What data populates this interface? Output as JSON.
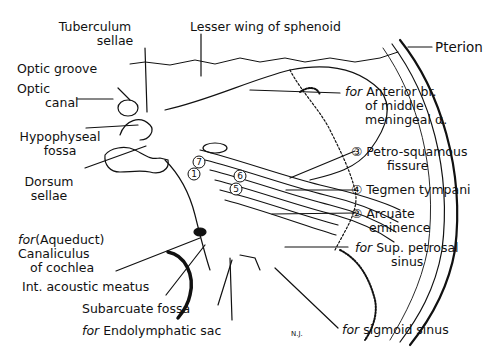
{
  "figure": {
    "labels": {
      "tuberculum_sellae": [
        "Tuberculum",
        "sellae"
      ],
      "lesser_wing": "Lesser wing of sphenoid",
      "pterion": "Pterion",
      "optic_groove": "Optic groove",
      "optic_canal": [
        "Optic",
        "canal"
      ],
      "hypophyseal_fossa": [
        "Hypophyseal",
        "fossa"
      ],
      "dorsum_sellae": [
        "Dorsum",
        "sellae"
      ],
      "aqueduct": [
        "for",
        "(Aqueduct)",
        "Canaliculus",
        "of cochlea"
      ],
      "int_acoustic": "Int. acoustic meatus",
      "subarcuate": "Subarcuate fossa",
      "endolymphatic": [
        "for",
        "Endolymphatic sac"
      ],
      "sigmoid": [
        "for",
        "sigmoid sinus"
      ],
      "sup_petrosal": [
        "for",
        "Sup. petrosal",
        "sinus"
      ],
      "arcuate": [
        "②",
        "Arcuate",
        "eminence"
      ],
      "tegmen": [
        "④",
        "Tegmen tympani"
      ],
      "petro_squamous": [
        "③",
        "Petro-squamous",
        "fissure"
      ],
      "anterior_br": [
        "for",
        "Anterior br.",
        "of middle",
        "meningeal α."
      ]
    },
    "numbered_markers": [
      "1",
      "5",
      "6",
      "7"
    ],
    "corner_mark": "N.J."
  }
}
